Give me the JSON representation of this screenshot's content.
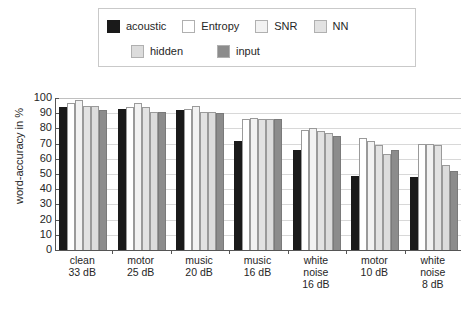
{
  "legend": {
    "rows": [
      [
        {
          "label": "acoustic",
          "color": "#1a1a1a"
        },
        {
          "label": "Entropy",
          "color": "#ffffff"
        },
        {
          "label": "SNR",
          "color": "#f2f2f2"
        },
        {
          "label": "NN",
          "color": "#e2e2e2"
        }
      ],
      [
        {
          "label": "hidden",
          "color": "#dcdcdc"
        },
        {
          "label": "input",
          "color": "#8c8c8c"
        }
      ]
    ]
  },
  "axes": {
    "y_title": "word-accuracy in %",
    "y_ticks": [
      "100",
      "90",
      "80",
      "70",
      "60",
      "50",
      "40",
      "30",
      "20",
      "10",
      "0"
    ],
    "x_groups": [
      [
        "clean",
        "33 dB"
      ],
      [
        "motor",
        "25 dB"
      ],
      [
        "music",
        "20 dB"
      ],
      [
        "music",
        "16 dB"
      ],
      [
        "white",
        "noise",
        "16 dB"
      ],
      [
        "motor",
        "10 dB"
      ],
      [
        "white",
        "noise",
        "8 dB"
      ]
    ]
  },
  "caption": "",
  "chart_data": {
    "type": "bar",
    "title": "",
    "xlabel": "",
    "ylabel": "word-accuracy in %",
    "ylim": [
      0,
      100
    ],
    "grid": true,
    "legend_position": "top",
    "categories": [
      "clean 33 dB",
      "motor 25 dB",
      "music 20 dB",
      "music 16 dB",
      "white noise 16 dB",
      "motor 10 dB",
      "white noise 8 dB"
    ],
    "series": [
      {
        "name": "acoustic",
        "color": "#1a1a1a",
        "values": [
          94,
          93,
          92,
          72,
          66,
          49,
          48
        ]
      },
      {
        "name": "Entropy",
        "color": "#ffffff",
        "values": [
          97,
          94,
          93,
          86,
          79,
          74,
          70
        ]
      },
      {
        "name": "SNR",
        "color": "#f2f2f2",
        "values": [
          99,
          97,
          95,
          87,
          80,
          72,
          70
        ]
      },
      {
        "name": "NN",
        "color": "#e2e2e2",
        "values": [
          95,
          94,
          91,
          86,
          78,
          69,
          69
        ]
      },
      {
        "name": "hidden",
        "color": "#dcdcdc",
        "values": [
          95,
          91,
          91,
          86,
          77,
          63,
          56
        ]
      },
      {
        "name": "input",
        "color": "#8c8c8c",
        "values": [
          92,
          91,
          90,
          86,
          75,
          66,
          52
        ]
      }
    ]
  }
}
